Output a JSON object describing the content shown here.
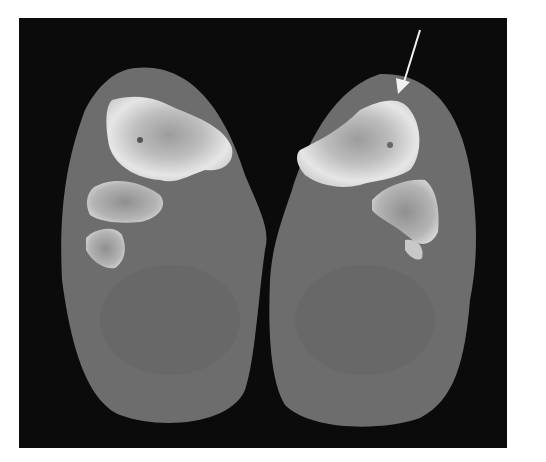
{
  "image": {
    "description": "Axial CT scan of both feet showing tarsal bones; arrow indicates finding on right-side bone",
    "colors": {
      "background": "#0b0b0b",
      "soft_tissue": "#6e6e6e",
      "soft_tissue_dark": "#5e5e5e",
      "bone": "#d8d8d8",
      "bone_core": "#a9a9a9",
      "arrow": "#f2f2f2"
    },
    "annotations": [
      {
        "type": "arrow",
        "from": [
          420,
          30
        ],
        "to": [
          400,
          92
        ]
      }
    ]
  }
}
